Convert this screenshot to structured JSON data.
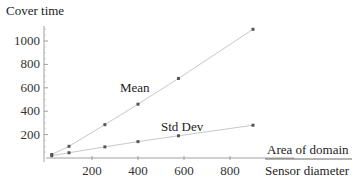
{
  "chart_data": {
    "type": "line",
    "title": "",
    "ylabel": "Cover time",
    "xlabel_numerator": "Area of domain",
    "xlabel_denominator": "Sensor diameter",
    "xlim": [
      0,
      950
    ],
    "ylim": [
      0,
      1150
    ],
    "xticks": [
      200,
      400,
      600,
      800
    ],
    "yticks": [
      200,
      400,
      600,
      800,
      1000
    ],
    "grid": false,
    "legend": "inline labels",
    "x": [
      25,
      100,
      256,
      400,
      576,
      900
    ],
    "series": [
      {
        "name": "Mean",
        "values": [
          30,
          100,
          285,
          460,
          680,
          1100
        ],
        "label_pos": [
          370,
          560
        ]
      },
      {
        "name": "Std Dev",
        "values": [
          20,
          45,
          95,
          140,
          190,
          280
        ],
        "label_pos": [
          520,
          210
        ]
      }
    ]
  },
  "labels": {
    "ylabel": "Cover time",
    "xlabel_top": "Area of domain",
    "xlabel_bottom": "Sensor diameter",
    "mean": "Mean",
    "std": "Std Dev"
  },
  "colors": {
    "line": "#c8c8c8",
    "marker": "#555555",
    "axis": "#888888",
    "text": "#222222"
  }
}
